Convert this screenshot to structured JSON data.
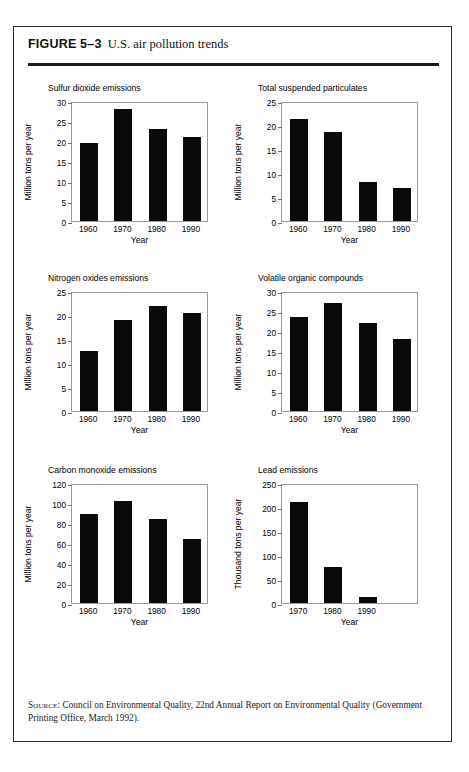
{
  "figure": {
    "number_label": "FIGURE 5–3",
    "caption": "U.S. air pollution trends",
    "source_prefix": "Source:",
    "source_text": " Council on Environmental Quality, 22nd Annual Report on Environmental Quality (Government Printing Office, March 1992)."
  },
  "chart_data": [
    {
      "type": "bar",
      "title": "Sulfur dioxide emissions",
      "xlabel": "Year",
      "ylabel": "Million tons per year",
      "categories": [
        "1960",
        "1970",
        "1980",
        "1990"
      ],
      "values": [
        19.5,
        28.0,
        23.1,
        20.9
      ],
      "ylim": [
        0,
        30
      ],
      "yticks": [
        0,
        5,
        10,
        15,
        20,
        25,
        30
      ],
      "grid": false,
      "legend": "none"
    },
    {
      "type": "bar",
      "title": "Total suspended particulates",
      "xlabel": "Year",
      "ylabel": "Million tons per year",
      "categories": [
        "1960",
        "1970",
        "1980",
        "1990"
      ],
      "values": [
        21.3,
        18.5,
        8.1,
        6.8
      ],
      "ylim": [
        0,
        25
      ],
      "yticks": [
        0,
        5,
        10,
        15,
        20,
        25
      ],
      "grid": false,
      "legend": "none"
    },
    {
      "type": "bar",
      "title": "Nitrogen oxides emissions",
      "xlabel": "Year",
      "ylabel": "Million tons per year",
      "categories": [
        "1960",
        "1970",
        "1980",
        "1990"
      ],
      "values": [
        12.6,
        19.0,
        21.8,
        20.5
      ],
      "ylim": [
        0,
        25
      ],
      "yticks": [
        0,
        5,
        10,
        15,
        20,
        25
      ],
      "grid": false,
      "legend": "none"
    },
    {
      "type": "bar",
      "title": "Volatile organic compounds",
      "xlabel": "Year",
      "ylabel": "Million tons per year",
      "categories": [
        "1960",
        "1970",
        "1980",
        "1990"
      ],
      "values": [
        23.5,
        27.1,
        22.0,
        18.0
      ],
      "ylim": [
        0,
        30
      ],
      "yticks": [
        0,
        5,
        10,
        15,
        20,
        25,
        30
      ],
      "grid": false,
      "legend": "none"
    },
    {
      "type": "bar",
      "title": "Carbon monoxide emissions",
      "xlabel": "Year",
      "ylabel": "Million tons per year",
      "categories": [
        "1960",
        "1970",
        "1980",
        "1990"
      ],
      "values": [
        89,
        102,
        84.5,
        64
      ],
      "ylim": [
        0,
        120
      ],
      "yticks": [
        0,
        20,
        40,
        60,
        80,
        100,
        120
      ],
      "grid": false,
      "legend": "none"
    },
    {
      "type": "bar",
      "title": "Lead emissions",
      "xlabel": "Year",
      "ylabel": "Thousand tons per year",
      "categories": [
        "1970",
        "1980",
        "1990"
      ],
      "values": [
        210,
        75,
        12
      ],
      "ylim": [
        0,
        250
      ],
      "yticks": [
        0,
        50,
        100,
        150,
        200,
        250
      ],
      "grid": false,
      "legend": "none",
      "slots": 4
    }
  ]
}
